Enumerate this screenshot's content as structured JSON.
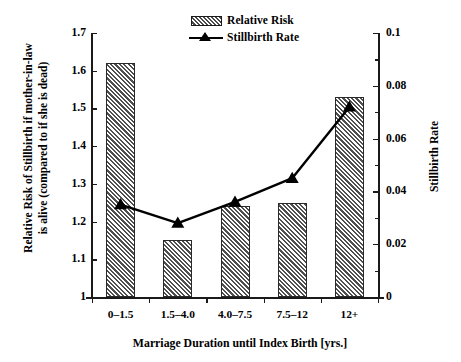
{
  "chart_data": {
    "type": "bar",
    "title": "",
    "xlabel": "Marriage Duration until Index Birth [yrs.]",
    "ylabel": "Relative Risk of Stillbirth if mother-in-law is alive (compared to if she is dead)",
    "ylabel_line1": "Relative Risk of Stillbirth if mother-in-law",
    "ylabel_line2": "is alive (compared to if she is dead)",
    "ylabel_right": "Stillbirth Rate",
    "categories": [
      "0–1.5",
      "1.5–4.0",
      "4.0–7.5",
      "7.5–12",
      "12+"
    ],
    "series": [
      {
        "name": "Relative Risk",
        "type": "bar",
        "axis": "left",
        "values": [
          1.62,
          1.15,
          1.24,
          1.25,
          1.53
        ]
      },
      {
        "name": "Stillbirth Rate",
        "type": "line",
        "axis": "right",
        "marker": "triangle",
        "values": [
          0.035,
          0.028,
          0.036,
          0.045,
          0.072
        ]
      }
    ],
    "ylim": [
      1,
      1.7
    ],
    "ylim_right": [
      0,
      0.1
    ],
    "yticks": [
      "1",
      "1.1",
      "1.2",
      "1.3",
      "1.4",
      "1.5",
      "1.6",
      "1.7"
    ],
    "ytick_values": [
      1,
      1.1,
      1.2,
      1.3,
      1.4,
      1.5,
      1.6,
      1.7
    ],
    "yticks_right": [
      "0",
      "0.02",
      "0.04",
      "0.06",
      "0.08",
      "0.1"
    ],
    "ytick_values_right": [
      0,
      0.02,
      0.04,
      0.06,
      0.08,
      0.1
    ],
    "ytick_minor_right": [
      0.01,
      0.03,
      0.05,
      0.07,
      0.09
    ],
    "grid": false,
    "legend_position": "top-center",
    "colors": {
      "bar_fill": "#a5a5a5",
      "bar_hatch": "#4f4f4f",
      "bar_edge": "#2a2a2a",
      "line": "#000000",
      "marker": "#000000",
      "axis": "#1a1a1a",
      "background": "#ffffff"
    }
  },
  "legend": {
    "items": [
      {
        "label": "Relative Risk",
        "icon": "hatched-swatch-icon"
      },
      {
        "label": "Stillbirth Rate",
        "icon": "line-triangle-icon"
      }
    ]
  }
}
